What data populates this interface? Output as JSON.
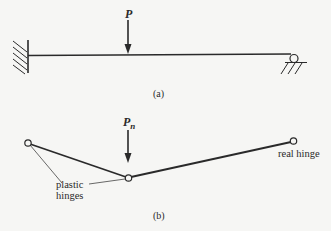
{
  "figure_a": {
    "caption": "(a)",
    "load_label": "P",
    "support_left": "fixed",
    "support_right": "roller"
  },
  "figure_b": {
    "caption": "(b)",
    "load_label": "P",
    "load_subscript": "n",
    "annotation_plastic_line1": "plastic",
    "annotation_plastic_line2": "hinges",
    "annotation_real": "real hinge"
  },
  "colors": {
    "background": "#f6f6f4",
    "ink": "#2a2a2a"
  }
}
